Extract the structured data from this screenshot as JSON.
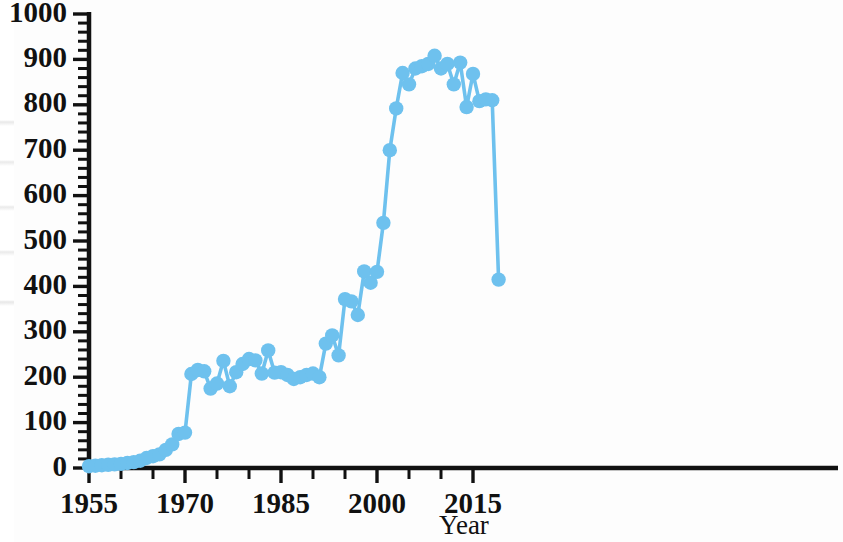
{
  "chart_data": {
    "type": "line",
    "title": "",
    "subtitle": "",
    "xlabel": "Year",
    "ylabel": "",
    "xlim": [
      1953.5,
      2019.5
    ],
    "ylim": [
      0,
      1000
    ],
    "grid": false,
    "legend": null,
    "series_color": "#6EC1EE",
    "marker": "circle",
    "x_tick_labels": [
      "1955",
      "1970",
      "1985",
      "2000",
      "2015"
    ],
    "x_tick_values": [
      1955,
      1970,
      1985,
      2000,
      2015
    ],
    "x_minor_tick_step": 5,
    "y_tick_labels": [
      "0",
      "100",
      "200",
      "300",
      "400",
      "500",
      "600",
      "700",
      "800",
      "900",
      "1000"
    ],
    "y_tick_values": [
      0,
      100,
      200,
      300,
      400,
      500,
      600,
      700,
      800,
      900,
      1000
    ],
    "y_minor_tick_step": 20,
    "series": [
      {
        "name": "Publications per year",
        "x": [
          1955,
          1956,
          1957,
          1958,
          1959,
          1960,
          1961,
          1962,
          1963,
          1964,
          1965,
          1966,
          1967,
          1968,
          1969,
          1970,
          1971,
          1972,
          1973,
          1974,
          1975,
          1976,
          1977,
          1978,
          1979,
          1980,
          1981,
          1982,
          1983,
          1984,
          1985,
          1986,
          1987,
          1988,
          1989,
          1990,
          1991,
          1992,
          1993,
          1994,
          1995,
          1996,
          1997,
          1998,
          1999,
          2000,
          2001,
          2002,
          2003,
          2004,
          2005,
          2006,
          2007,
          2008,
          2009,
          2010,
          2011,
          2012,
          2013,
          2014,
          2015,
          2016,
          2017,
          2018,
          2019
        ],
        "values": [
          4,
          5,
          6,
          7,
          8,
          9,
          11,
          13,
          16,
          22,
          26,
          30,
          40,
          52,
          75,
          78,
          207,
          216,
          213,
          175,
          186,
          236,
          180,
          211,
          229,
          240,
          237,
          208,
          259,
          210,
          211,
          205,
          196,
          200,
          205,
          208,
          200,
          274,
          292,
          248,
          372,
          367,
          337,
          433,
          408,
          432,
          540,
          700,
          792,
          870,
          845,
          880,
          885,
          890,
          908,
          880,
          890,
          845,
          893,
          795,
          868,
          808,
          812,
          810,
          415
        ]
      }
    ]
  },
  "axes": {
    "y_axis_name": "count-axis",
    "x_axis_name": "year-axis"
  }
}
